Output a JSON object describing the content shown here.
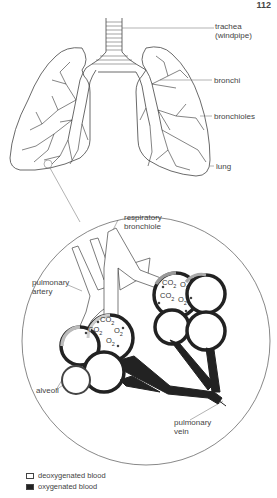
{
  "page_number": "112",
  "labels": {
    "trachea": "trachea",
    "trachea_alt": "(windpipe)",
    "bronchi": "bronchi",
    "bronchioles": "bronchioles",
    "lung": "lung",
    "respiratory_bronchiole_1": "respiratory",
    "respiratory_bronchiole_2": "bronchiole",
    "pulmonary_artery_1": "pulmonary",
    "pulmonary_artery_2": "artery",
    "alveoli": "alveoli",
    "pulmonary_vein_1": "pulmonary",
    "pulmonary_vein_2": "vein"
  },
  "gases": {
    "co2": "CO",
    "o2": "O",
    "sub": "2"
  },
  "legend": [
    {
      "swatch": "light",
      "label": "deoxygenated blood"
    },
    {
      "swatch": "dark",
      "label": "oxygenated blood"
    }
  ],
  "colors": {
    "ink": "#222222",
    "line": "#555555",
    "background": "#ffffff"
  }
}
